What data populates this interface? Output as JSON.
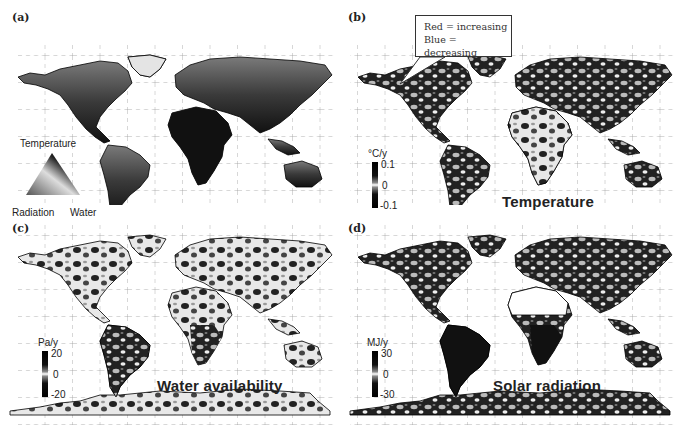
{
  "panels": [
    {
      "id": "a",
      "label": "(a)",
      "legend": {
        "type": "ternary-triangle",
        "top": "Temperature",
        "bottom_left": "Radiation",
        "bottom_right": "Water"
      }
    },
    {
      "id": "b",
      "label": "(b)",
      "title": "Temperature",
      "colorbar": {
        "unit": "°C/y",
        "max": "0.1",
        "mid": "0",
        "min": "-0.1"
      },
      "callout": {
        "line1": "Red = increasing",
        "line2": "Blue = decreasing"
      }
    },
    {
      "id": "c",
      "label": "(c)",
      "title": "Water availability",
      "colorbar": {
        "unit": "Pa/y",
        "max": "20",
        "mid": "0",
        "min": "-20"
      }
    },
    {
      "id": "d",
      "label": "(d)",
      "title": "Solar radiation",
      "colorbar": {
        "unit": "MJ/y",
        "max": "30",
        "mid": "0",
        "min": "-30"
      }
    }
  ],
  "colors": {
    "land_dark": "#1a1a1a",
    "land_mid": "#6a6a6a",
    "ocean": "#ffffff",
    "grid": "#999999"
  }
}
